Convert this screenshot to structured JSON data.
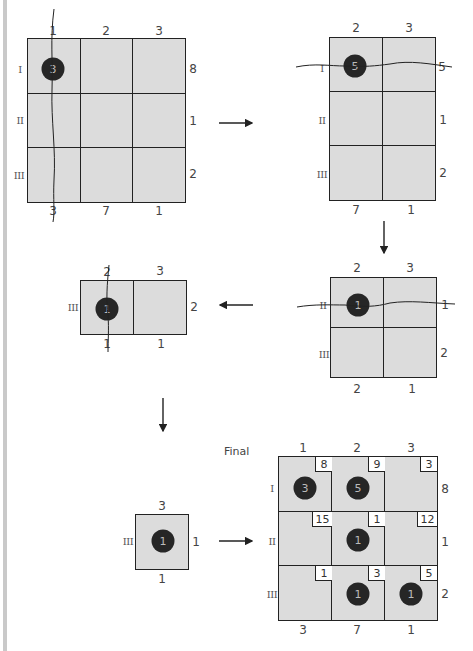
{
  "diagram": {
    "colors": {
      "cell_fill": "#dcdcdc",
      "line": "#222222",
      "dot": "#262626",
      "background": "#ffffff"
    },
    "step1": {
      "col_labels": [
        "1",
        "2",
        "3"
      ],
      "row_labels": [
        "I",
        "II",
        "III"
      ],
      "supply": [
        "8",
        "1",
        "2"
      ],
      "demand": [
        "3",
        "7",
        "1"
      ],
      "allocation": {
        "row": "I",
        "col": "1",
        "value": "3"
      },
      "crossed_out": "column 1"
    },
    "step2": {
      "col_labels": [
        "2",
        "3"
      ],
      "row_labels": [
        "I",
        "II",
        "III"
      ],
      "supply": [
        "5",
        "1",
        "2"
      ],
      "demand": [
        "7",
        "1"
      ],
      "allocation": {
        "row": "I",
        "col": "2",
        "value": "5"
      },
      "crossed_out": "row I"
    },
    "step3": {
      "col_labels": [
        "2",
        "3"
      ],
      "row_labels": [
        "II",
        "III"
      ],
      "supply": [
        "1",
        "2"
      ],
      "demand": [
        "2",
        "1"
      ],
      "allocation": {
        "row": "II",
        "col": "2",
        "value": "1"
      },
      "crossed_out": "row II"
    },
    "step4": {
      "col_labels": [
        "2",
        "3"
      ],
      "row_labels": [
        "III"
      ],
      "supply": [
        "2"
      ],
      "demand": [
        "1",
        "1"
      ],
      "allocation": {
        "row": "III",
        "col": "2",
        "value": "1"
      },
      "crossed_out": "column 2"
    },
    "step5": {
      "col_labels": [
        "3"
      ],
      "row_labels": [
        "III"
      ],
      "supply": [
        "1"
      ],
      "demand": [
        "1"
      ],
      "allocation": {
        "row": "III",
        "col": "3",
        "value": "1"
      }
    },
    "final": {
      "title": "Final",
      "col_labels": [
        "1",
        "2",
        "3"
      ],
      "row_labels": [
        "I",
        "II",
        "III"
      ],
      "supply": [
        "8",
        "1",
        "2"
      ],
      "demand": [
        "3",
        "7",
        "1"
      ],
      "costs": [
        [
          "8",
          "9",
          "3"
        ],
        [
          "15",
          "1",
          "12"
        ],
        [
          "1",
          "3",
          "5"
        ]
      ],
      "allocations": [
        [
          "3",
          "5",
          ""
        ],
        [
          "",
          "1",
          ""
        ],
        [
          "",
          "1",
          "1"
        ]
      ]
    },
    "arrows": [
      "right",
      "down",
      "left",
      "down",
      "right"
    ]
  }
}
